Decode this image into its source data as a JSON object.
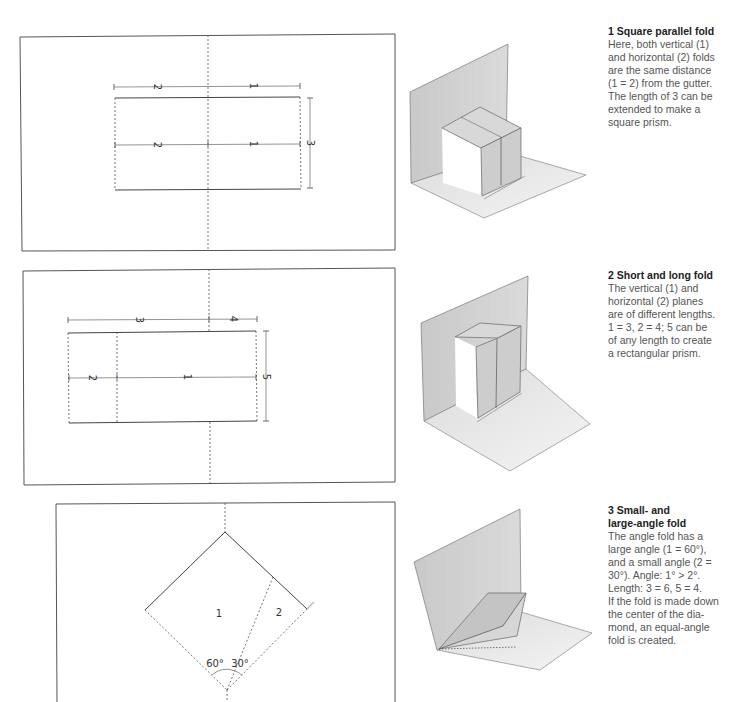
{
  "folds": [
    {
      "number": "1",
      "title": "1 Square parallel fold",
      "body": "Here, both vertical (1)\nand horizontal (2) folds\nare the same distance\n(1 = 2) from the gutter.\nThe length of 3 can be\nextended to make a\nsquare prism.",
      "diagram_labels": {
        "top_left": "2",
        "top_right": "1",
        "mid_left": "2",
        "mid_right": "1",
        "height": "3"
      }
    },
    {
      "number": "2",
      "title": "2 Short and long fold",
      "body": "The vertical (1) and\nhorizontal (2) planes\nare of different lengths.\n1 = 3, 2 = 4; 5 can be\nof any length to create\na rectangular prism.",
      "diagram_labels": {
        "top_left": "3",
        "top_right": "4",
        "mid_left": "2",
        "mid_right": "1",
        "height": "5"
      }
    },
    {
      "number": "3",
      "title": "3 Small- and\nlarge-angle fold",
      "body": "The angle fold has a\nlarge angle (1 = 60°),\nand a small angle (2 =\n30°). Angle: 1° > 2°.\nLength: 3 = 6, 5 = 4.\nIf the fold is made down\nthe center of the dia-\nmond, an equal-angle\nfold is created.",
      "diagram_labels": {
        "region_large": "1",
        "region_small": "2",
        "angle_large": "60°",
        "angle_small": "30°"
      }
    }
  ],
  "colors": {
    "line": "#444444",
    "dim_line": "#666666",
    "paper_grey": "#cfcfcf",
    "paper_light": "#e6e6e6",
    "text": "#555555",
    "title": "#222222"
  }
}
